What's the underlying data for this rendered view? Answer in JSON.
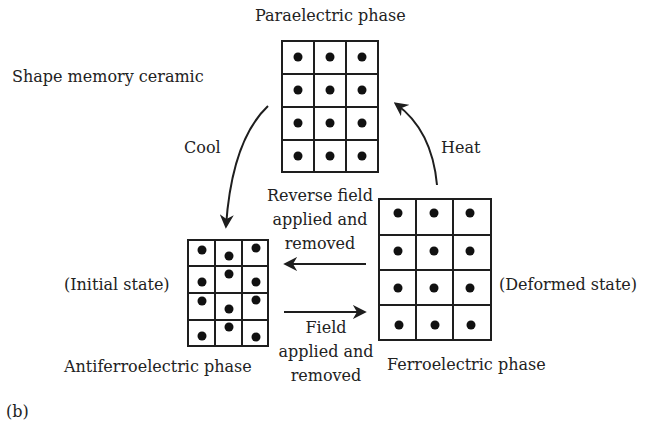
{
  "diagram": {
    "title": "Shape memory ceramic",
    "figure_label": "(b)",
    "phases": {
      "paraelectric": {
        "name": "Paraelectric phase",
        "grid": {
          "rows": 4,
          "cols": 3,
          "dot_arrangement": "centered"
        }
      },
      "antiferroelectric": {
        "name": "Antiferroelectric phase",
        "state": "(Initial state)",
        "grid": {
          "rows": 4,
          "cols": 3,
          "dot_arrangement": "alternating displaced"
        }
      },
      "ferroelectric": {
        "name": "Ferroelectric phase",
        "state": "(Deformed state)",
        "grid": {
          "rows": 4,
          "cols": 3,
          "dot_arrangement": "uniformly displaced upward"
        }
      }
    },
    "transitions": {
      "cool": {
        "label": "Cool",
        "from": "Paraelectric phase",
        "to": "Antiferroelectric phase"
      },
      "heat": {
        "label": "Heat",
        "from": "Ferroelectric phase",
        "to": "Paraelectric phase"
      },
      "reverse_field": {
        "lines": [
          "Reverse field",
          "applied and",
          "removed"
        ],
        "from": "Ferroelectric phase",
        "to": "Antiferroelectric phase"
      },
      "field": {
        "lines": [
          "Field",
          "applied and",
          "removed"
        ],
        "from": "Antiferroelectric phase",
        "to": "Ferroelectric phase"
      }
    },
    "colors": {
      "ink": "#1e1e1e",
      "background": "#ffffff"
    }
  }
}
